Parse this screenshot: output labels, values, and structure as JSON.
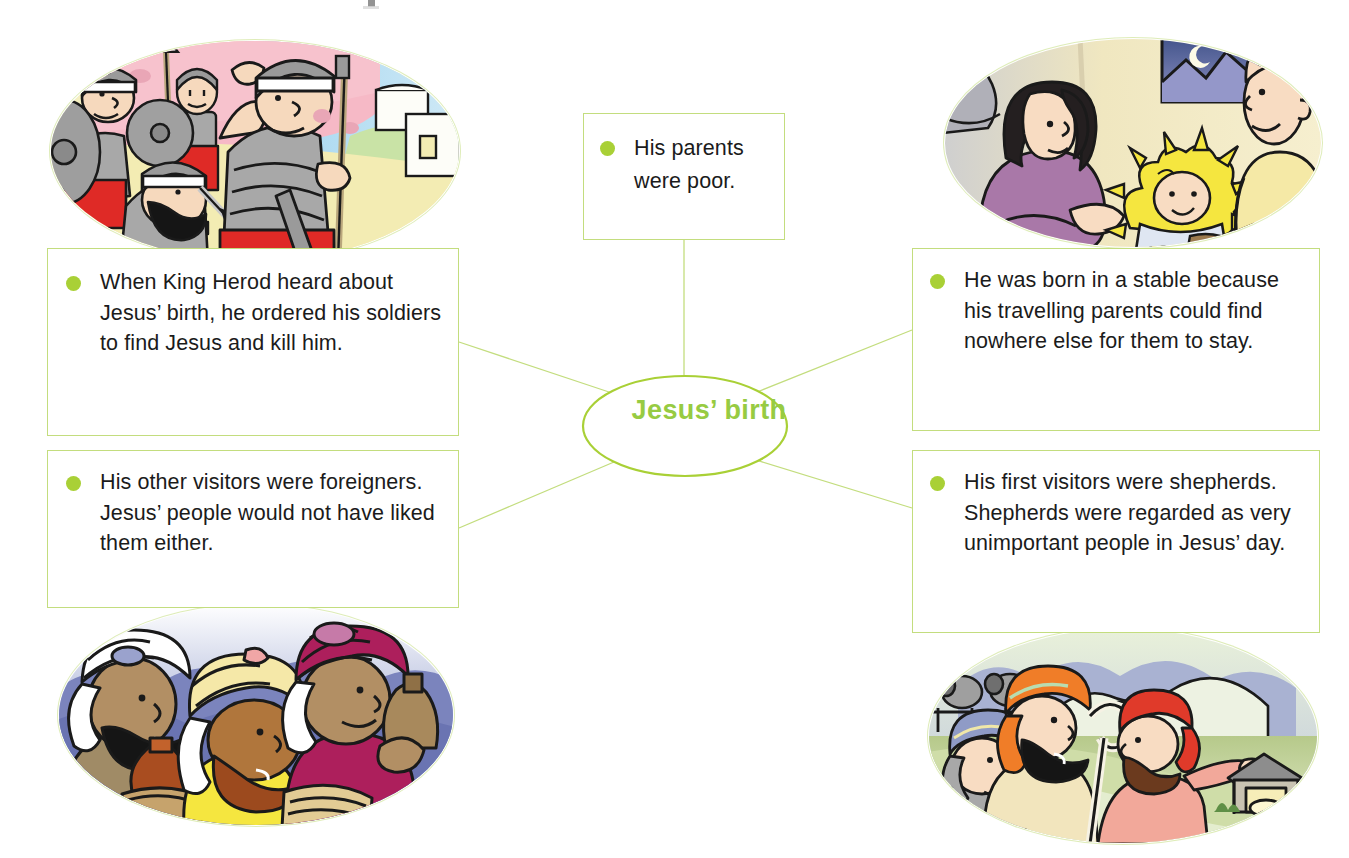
{
  "diagram": {
    "type": "mind-map",
    "centre": {
      "label": "Jesus’ birth",
      "shape": "ellipse"
    },
    "accent_colors": {
      "bullet_green": "#a9d036",
      "border_green": "#c3dd7e",
      "hub_text_green": "#97cb42",
      "body_text": "#1b1b1b"
    },
    "branches": [
      {
        "id": "herod",
        "text": "When King Herod heard about Jesus’ birth, he ordered his soldiers to find Jesus and kill him.",
        "bullet": "bullet-dot",
        "position": "top-left",
        "illustration": {
          "name": "roman-soldiers-illustration",
          "caption": "Roman soldiers with shields, spears and helmets marching in front of a pink rock wall and a white town building"
        }
      },
      {
        "id": "parents-poor",
        "text": "His parents were poor.",
        "bullet": "bullet-dot",
        "position": "top-centre",
        "illustration": null
      },
      {
        "id": "stable",
        "text": "He was born in a stable because his travelling parents could find nowhere else for them to stay.",
        "bullet": "bullet-dot",
        "position": "top-right",
        "illustration": {
          "name": "nativity-illustration",
          "caption": "Mary in a purple robe leaning over baby Jesus on yellow straw, Joseph in a yellow shirt, a donkey and a window with a crescent moon"
        }
      },
      {
        "id": "shepherds",
        "text": "His first visitors were shepherds. Shepherds were regarded as very unimportant people in Jesus’ day.",
        "bullet": "bullet-dot",
        "position": "bottom-right",
        "illustration": {
          "name": "shepherds-illustration",
          "caption": "Three shepherds with a crook and sheep on a green hillside, one pointing toward a stable, with mountains behind"
        }
      },
      {
        "id": "foreigners",
        "text": "His other visitors were foreigners. Jesus’ people would not have liked them either.",
        "bullet": "bullet-dot",
        "position": "bottom-left",
        "illustration": {
          "name": "wise-men-illustration",
          "caption": "Three wise men in white, yellow and magenta turbans carrying gift jars against a blue and purple hill background"
        }
      }
    ]
  }
}
